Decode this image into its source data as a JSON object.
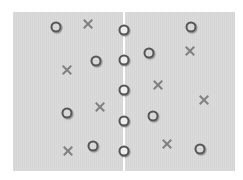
{
  "board": {
    "background": "#d9d9d9",
    "divider_color": "#ffffff",
    "divider_x": 124
  },
  "pieces": {
    "circles": [
      {
        "x": 56,
        "y": 27
      },
      {
        "x": 96,
        "y": 61
      },
      {
        "x": 67,
        "y": 113
      },
      {
        "x": 93,
        "y": 146
      },
      {
        "x": 149,
        "y": 53
      },
      {
        "x": 191,
        "y": 27
      },
      {
        "x": 153,
        "y": 116
      },
      {
        "x": 200,
        "y": 149
      }
    ],
    "center_circles": [
      {
        "x": 124,
        "y": 30
      },
      {
        "x": 124,
        "y": 60
      },
      {
        "x": 124,
        "y": 90
      },
      {
        "x": 124,
        "y": 121
      },
      {
        "x": 124,
        "y": 151
      }
    ],
    "crosses": [
      {
        "x": 88,
        "y": 24
      },
      {
        "x": 67,
        "y": 70
      },
      {
        "x": 100,
        "y": 107
      },
      {
        "x": 68,
        "y": 151
      },
      {
        "x": 190,
        "y": 51
      },
      {
        "x": 158,
        "y": 85
      },
      {
        "x": 204,
        "y": 100
      },
      {
        "x": 167,
        "y": 144
      }
    ]
  }
}
